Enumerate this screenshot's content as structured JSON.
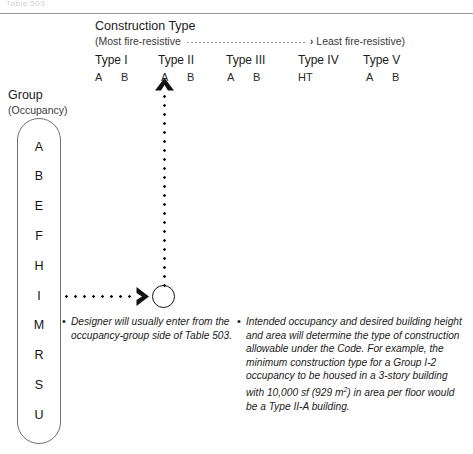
{
  "page": {
    "ghost_text": "Table 503",
    "accent_color": "#111111",
    "rule_color": "#9a9a9a"
  },
  "header": {
    "title": "Construction Type",
    "scale_left": "(Most fire-resistive",
    "scale_arrow": "›",
    "scale_right": "Least fire-resistive)",
    "columns": [
      {
        "label": "Type I",
        "x": 0,
        "subs": [
          {
            "label": "A",
            "x": 0
          },
          {
            "label": "B",
            "x": 26
          }
        ]
      },
      {
        "label": "Type II",
        "x": 63,
        "subs": [
          {
            "label": "A",
            "x": 66
          },
          {
            "label": "B",
            "x": 92
          }
        ]
      },
      {
        "label": "Type III",
        "x": 131,
        "subs": [
          {
            "label": "A",
            "x": 132
          },
          {
            "label": "B",
            "x": 158
          }
        ]
      },
      {
        "label": "Type IV",
        "x": 203,
        "subs": [
          {
            "label": "HT",
            "x": 203
          }
        ]
      },
      {
        "label": "Type V",
        "x": 268,
        "subs": [
          {
            "label": "A",
            "x": 271
          },
          {
            "label": "B",
            "x": 297
          }
        ]
      }
    ]
  },
  "group_axis": {
    "title": "Group",
    "subtitle": "(Occupancy)",
    "occupancies": [
      "A",
      "B",
      "E",
      "F",
      "H",
      "I",
      "M",
      "R",
      "S",
      "U"
    ]
  },
  "diagram": {
    "entry_arrow_label": "horizontal-entry-from-occupancy",
    "exit_arrow_label": "vertical-exit-to-construction-type",
    "intersection_label": "table-intersection-node"
  },
  "notes": {
    "bullet": "•",
    "left": "Designer will usually enter from the occupancy-group side of Table 503.",
    "right_part1": "Intended occupancy and desired building height and area will determine the type of construction allowable under the Code. For example, the minimum construction type for a Group I-2 occupancy to be housed in a 3-story building with 10,000 sf (929 m",
    "right_sup": "2",
    "right_part2": ") in area per floor would be a Type II-A building."
  }
}
